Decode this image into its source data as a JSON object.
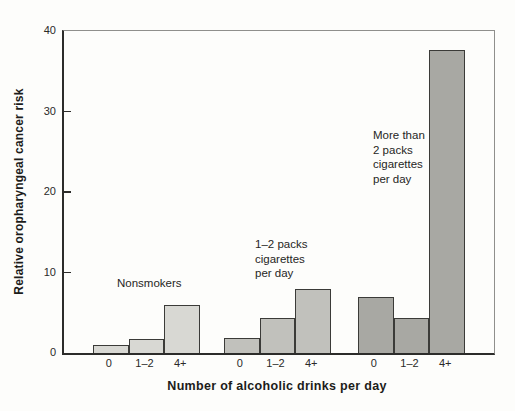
{
  "figure": {
    "background": "#fdfdfb",
    "axis_color": "#2c2c2a",
    "frame_color": "#8f8f8c",
    "bar_outline_color": "#3b3b38"
  },
  "chart_data": {
    "type": "bar",
    "title": "",
    "ylabel": "Relative oropharyngeal cancer risk",
    "xlabel": "Number of alcoholic drinks per day",
    "ylim": [
      0,
      40
    ],
    "yticks": [
      0,
      10,
      20,
      30,
      40
    ],
    "grid": false,
    "legend_position": "none",
    "categories": [
      "0",
      "1–2",
      "4+"
    ],
    "groups": [
      {
        "name": "Nonsmokers",
        "label_lines": [
          "Nonsmokers"
        ],
        "color": "#d8d8d3",
        "values": [
          1.0,
          1.7,
          6.0
        ]
      },
      {
        "name": "1–2 packs cigarettes per day",
        "label_lines": [
          "1–2 packs",
          "cigarettes",
          "per day"
        ],
        "color": "#c1c1bc",
        "values": [
          1.9,
          4.4,
          8.0
        ]
      },
      {
        "name": "More than 2 packs cigarettes per day",
        "label_lines": [
          "More than",
          "2 packs",
          "cigarettes",
          "per day"
        ],
        "color": "#a8a8a3",
        "values": [
          7.0,
          4.4,
          37.7
        ]
      }
    ]
  }
}
